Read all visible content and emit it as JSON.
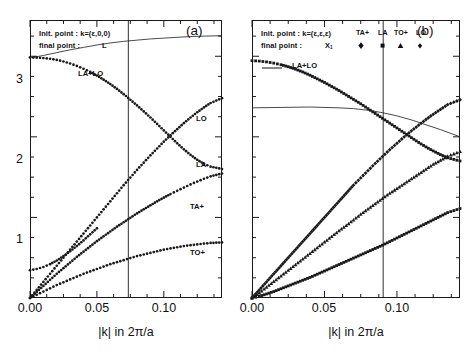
{
  "figure": {
    "axis_title": "|k| in 2π/a",
    "y_ticks": [
      "1",
      "2",
      "3"
    ],
    "x_ticks": [
      "0.00",
      "0.05",
      "0.10"
    ]
  },
  "panel_a": {
    "tag": "(a)",
    "init_label": "Init. point :  k=(ε,0,0)",
    "final_label": "final point :",
    "final_value": "L",
    "sum_label": "LA+LO",
    "curve_labels": [
      "LO",
      "LA",
      "TA+",
      "TO+"
    ]
  },
  "panel_b": {
    "tag": "(b)",
    "init_label": "Init. point :  k=(ε,ε,ε)",
    "final_label": "final point :",
    "final_value": "X",
    "final_value_sub": "1",
    "sum_label": "LA+LO",
    "legend_names": [
      "TA+",
      "LA",
      "TO+",
      "LO"
    ],
    "legend_markers": [
      "diamond",
      "square",
      "triangle",
      "diamond-small"
    ]
  },
  "chart_data": [
    {
      "type": "scatter",
      "title": "(a)",
      "xlabel": "|k| in 2π/a",
      "ylabel": "",
      "xlim": [
        0.0,
        0.1435
      ],
      "ylim": [
        0.0,
        3.45
      ],
      "xticks": [
        0.0,
        0.05,
        0.1
      ],
      "yticks": [
        1,
        2,
        3
      ],
      "grid": false,
      "vline_x": 0.0735,
      "annotations": [
        "Init. point :  k=(ε,0,0)",
        "final point :   L"
      ],
      "series": [
        {
          "name": "LA+LO",
          "style": "line",
          "x": [
            0.0,
            0.005,
            0.01,
            0.02,
            0.03,
            0.04,
            0.05,
            0.06,
            0.07,
            0.08,
            0.09,
            0.1,
            0.11,
            0.12,
            0.13,
            0.1435
          ],
          "y": [
            2.985,
            2.995,
            3.01,
            3.045,
            3.08,
            3.11,
            3.14,
            3.165,
            3.185,
            3.2,
            3.215,
            3.225,
            3.235,
            3.245,
            3.25,
            3.255
          ]
        },
        {
          "name": "LA",
          "style": "dots",
          "x": [
            0.0,
            0.005,
            0.01,
            0.015,
            0.02,
            0.025,
            0.03,
            0.035,
            0.04,
            0.045,
            0.05,
            0.055,
            0.06,
            0.065,
            0.07,
            0.075,
            0.08,
            0.085,
            0.09,
            0.095,
            0.1,
            0.105,
            0.11,
            0.115,
            0.12,
            0.125,
            0.13,
            0.135,
            0.1435
          ],
          "y": [
            2.985,
            2.983,
            2.978,
            2.968,
            2.955,
            2.935,
            2.91,
            2.88,
            2.845,
            2.805,
            2.76,
            2.71,
            2.655,
            2.595,
            2.53,
            2.46,
            2.39,
            2.315,
            2.24,
            2.16,
            2.08,
            2.0,
            1.92,
            1.845,
            1.775,
            1.715,
            1.665,
            1.63,
            1.6
          ]
        },
        {
          "name": "LO",
          "style": "dots",
          "x": [
            0.0,
            0.005,
            0.01,
            0.015,
            0.02,
            0.025,
            0.03,
            0.035,
            0.04,
            0.045,
            0.05,
            0.055,
            0.06,
            0.065,
            0.07,
            0.075,
            0.08,
            0.085,
            0.09,
            0.095,
            0.1,
            0.105,
            0.11,
            0.115,
            0.12,
            0.125,
            0.13,
            0.135,
            0.1435
          ],
          "y": [
            0.0,
            0.1,
            0.2,
            0.3,
            0.4,
            0.5,
            0.6,
            0.7,
            0.8,
            0.9,
            1.0,
            1.1,
            1.2,
            1.3,
            1.4,
            1.495,
            1.59,
            1.68,
            1.77,
            1.855,
            1.94,
            2.02,
            2.095,
            2.17,
            2.24,
            2.305,
            2.365,
            2.42,
            2.48
          ]
        },
        {
          "name": "TA+",
          "style": "dots",
          "x": [
            0.0,
            0.005,
            0.01,
            0.015,
            0.02,
            0.025,
            0.03,
            0.035,
            0.04,
            0.045,
            0.05,
            0.055,
            0.06,
            0.065,
            0.07,
            0.075,
            0.08,
            0.085,
            0.09,
            0.095,
            0.1,
            0.105,
            0.11,
            0.115,
            0.12,
            0.125,
            0.13,
            0.135,
            0.1435
          ],
          "y": [
            0.0,
            0.075,
            0.15,
            0.225,
            0.3,
            0.37,
            0.44,
            0.51,
            0.575,
            0.64,
            0.705,
            0.765,
            0.825,
            0.885,
            0.94,
            0.995,
            1.05,
            1.1,
            1.15,
            1.2,
            1.245,
            1.29,
            1.33,
            1.37,
            1.41,
            1.445,
            1.48,
            1.51,
            1.545
          ]
        },
        {
          "name": "TO+",
          "style": "dots",
          "x": [
            0.0,
            0.005,
            0.01,
            0.015,
            0.02,
            0.025,
            0.03,
            0.035,
            0.04,
            0.045,
            0.05,
            0.055,
            0.06,
            0.065,
            0.07,
            0.075,
            0.08,
            0.085,
            0.09,
            0.095,
            0.1,
            0.105,
            0.11,
            0.115,
            0.12,
            0.125,
            0.13,
            0.135,
            0.1435
          ],
          "y": [
            0.0,
            0.04,
            0.08,
            0.12,
            0.16,
            0.195,
            0.23,
            0.265,
            0.3,
            0.33,
            0.36,
            0.39,
            0.42,
            0.445,
            0.47,
            0.495,
            0.52,
            0.54,
            0.56,
            0.58,
            0.6,
            0.615,
            0.63,
            0.645,
            0.655,
            0.665,
            0.675,
            0.683,
            0.69
          ]
        },
        {
          "name": "TO+ lower branch start",
          "style": "dots",
          "x": [
            0.0,
            0.005,
            0.01,
            0.015,
            0.02,
            0.025,
            0.03,
            0.035,
            0.04,
            0.045,
            0.05
          ],
          "y": [
            0.345,
            0.36,
            0.385,
            0.42,
            0.465,
            0.52,
            0.58,
            0.645,
            0.715,
            0.79,
            0.865
          ]
        }
      ]
    },
    {
      "type": "scatter",
      "title": "(b)",
      "xlabel": "|k| in 2π/a",
      "ylabel": "",
      "xlim": [
        0.0,
        0.1435
      ],
      "ylim": [
        0.0,
        3.45
      ],
      "xticks": [
        0.0,
        0.05,
        0.1
      ],
      "yticks": [
        1,
        2,
        3
      ],
      "grid": false,
      "vline_x": 0.0905,
      "annotations": [
        "Init. point :  k=(ε,ε,ε)",
        "final point :   X1",
        "LA+LO"
      ],
      "legend": [
        "TA+",
        "LA",
        "TO+",
        "LO"
      ],
      "series": [
        {
          "name": "LA+LO",
          "style": "line",
          "x": [
            0.0,
            0.02,
            0.04,
            0.06,
            0.07,
            0.08,
            0.09,
            0.1,
            0.11,
            0.12,
            0.13,
            0.1435
          ],
          "y": [
            2.36,
            2.365,
            2.37,
            2.36,
            2.35,
            2.33,
            2.3,
            2.26,
            2.21,
            2.15,
            2.09,
            2.0
          ]
        },
        {
          "name": "LA",
          "style": "square",
          "x": [
            0.0,
            0.005,
            0.01,
            0.015,
            0.02,
            0.025,
            0.03,
            0.035,
            0.04,
            0.045,
            0.05,
            0.055,
            0.06,
            0.065,
            0.07,
            0.075,
            0.08,
            0.085,
            0.09,
            0.095,
            0.1,
            0.105,
            0.11,
            0.115,
            0.12,
            0.125,
            0.13,
            0.135,
            0.1435
          ],
          "y": [
            2.945,
            2.94,
            2.93,
            2.915,
            2.895,
            2.87,
            2.84,
            2.805,
            2.765,
            2.72,
            2.675,
            2.625,
            2.575,
            2.52,
            2.465,
            2.41,
            2.35,
            2.29,
            2.23,
            2.17,
            2.11,
            2.05,
            1.99,
            1.93,
            1.875,
            1.825,
            1.78,
            1.74,
            1.7
          ]
        },
        {
          "name": "LO",
          "style": "diamond",
          "x": [
            0.0,
            0.005,
            0.01,
            0.015,
            0.02,
            0.025,
            0.03,
            0.035,
            0.04,
            0.045,
            0.05,
            0.055,
            0.06,
            0.065,
            0.07,
            0.075,
            0.08,
            0.085,
            0.09,
            0.095,
            0.1,
            0.105,
            0.11,
            0.115,
            0.12,
            0.125,
            0.13,
            0.135,
            0.1435
          ],
          "y": [
            0.0,
            0.1,
            0.2,
            0.3,
            0.4,
            0.5,
            0.6,
            0.7,
            0.8,
            0.9,
            1.0,
            1.1,
            1.2,
            1.3,
            1.4,
            1.49,
            1.58,
            1.67,
            1.755,
            1.84,
            1.92,
            2.0,
            2.075,
            2.145,
            2.215,
            2.28,
            2.34,
            2.4,
            2.46
          ]
        },
        {
          "name": "TA+",
          "style": "triangle",
          "x": [
            0.0,
            0.005,
            0.01,
            0.015,
            0.02,
            0.025,
            0.03,
            0.035,
            0.04,
            0.045,
            0.05,
            0.055,
            0.06,
            0.065,
            0.07,
            0.075,
            0.08,
            0.085,
            0.09,
            0.095,
            0.1,
            0.105,
            0.11,
            0.115,
            0.12,
            0.125,
            0.13,
            0.135,
            0.1435
          ],
          "y": [
            0.0,
            0.065,
            0.135,
            0.205,
            0.275,
            0.345,
            0.415,
            0.485,
            0.555,
            0.625,
            0.695,
            0.765,
            0.835,
            0.9,
            0.97,
            1.04,
            1.105,
            1.17,
            1.235,
            1.3,
            1.36,
            1.42,
            1.48,
            1.54,
            1.6,
            1.66,
            1.71,
            1.76,
            1.82
          ]
        },
        {
          "name": "TO+",
          "style": "square",
          "x": [
            0.0,
            0.005,
            0.01,
            0.015,
            0.02,
            0.025,
            0.03,
            0.035,
            0.04,
            0.045,
            0.05,
            0.055,
            0.06,
            0.065,
            0.07,
            0.075,
            0.08,
            0.085,
            0.09,
            0.095,
            0.1,
            0.105,
            0.11,
            0.115,
            0.12,
            0.125,
            0.13,
            0.135,
            0.1435
          ],
          "y": [
            0.0,
            0.02,
            0.05,
            0.08,
            0.115,
            0.15,
            0.185,
            0.22,
            0.255,
            0.295,
            0.335,
            0.375,
            0.415,
            0.455,
            0.495,
            0.535,
            0.575,
            0.615,
            0.655,
            0.7,
            0.745,
            0.79,
            0.835,
            0.88,
            0.925,
            0.97,
            1.015,
            1.06,
            1.11
          ]
        }
      ]
    }
  ]
}
